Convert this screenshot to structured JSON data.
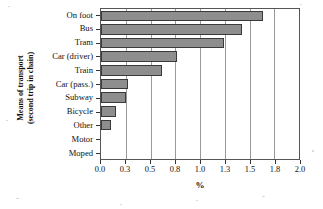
{
  "chart_data": {
    "type": "bar",
    "orientation": "horizontal",
    "title": "",
    "xlabel": "%",
    "ylabel": "Means of transport (second trip in chain)",
    "ylabel_lines": [
      "Means of transport",
      "(second trip in chain)"
    ],
    "categories": [
      "On foot",
      "Bus",
      "Tram",
      "Car (driver)",
      "Train",
      "Car (pass.)",
      "Subway",
      "Bicycle",
      "Other",
      "Motor",
      "Moped"
    ],
    "values": [
      1.62,
      1.41,
      1.23,
      0.76,
      0.61,
      0.27,
      0.25,
      0.15,
      0.1,
      0.0,
      0.0
    ],
    "xlim": [
      0.0,
      2.0
    ],
    "xticks": [
      0.0,
      0.25,
      0.5,
      0.75,
      1.0,
      1.25,
      1.5,
      1.75,
      2.0
    ],
    "xtick_labels": [
      "0.0",
      "0.3",
      "0.5",
      "0.8",
      "1.0",
      "1.3",
      "1.5",
      "1.8",
      "2.0"
    ],
    "grid": "vertical",
    "legend": "none",
    "bar_color": "#8e8e8e",
    "bar_edge_color": "#3a3a3a",
    "grid_color": "#9a9a9a",
    "axis_color": "#555555",
    "text_color": "#111111"
  }
}
